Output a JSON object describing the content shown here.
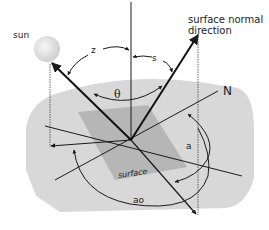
{
  "diagram": {
    "colors": {
      "background": "#ffffff",
      "ground": "#d8d8d8",
      "surface": "#b3b3b3",
      "lines": "#1a1a1a",
      "sun_fill": "#e6e6e6"
    },
    "labels": {
      "sun": "sun",
      "surface_normal_line1": "surface normal",
      "surface_normal_line2": "direction",
      "zenith_angle": "z",
      "surface_tilt_angle": "s",
      "incidence_angle": "θ",
      "north": "N",
      "surface_azimuth": "a",
      "solar_azimuth": "ao",
      "surface": "surface"
    },
    "elements": [
      {
        "name": "sun",
        "type": "circle"
      },
      {
        "name": "vertical-zenith-line",
        "type": "line"
      },
      {
        "name": "sun-ray-vector",
        "type": "arrow"
      },
      {
        "name": "surface-normal-vector",
        "type": "arrow"
      },
      {
        "name": "north-line",
        "type": "line"
      },
      {
        "name": "sun-projection-vector",
        "type": "arrow"
      },
      {
        "name": "normal-projection-vector",
        "type": "arrow"
      },
      {
        "name": "tilted-surface-plane",
        "type": "polygon"
      },
      {
        "name": "ground-plane",
        "type": "polygon"
      }
    ]
  }
}
